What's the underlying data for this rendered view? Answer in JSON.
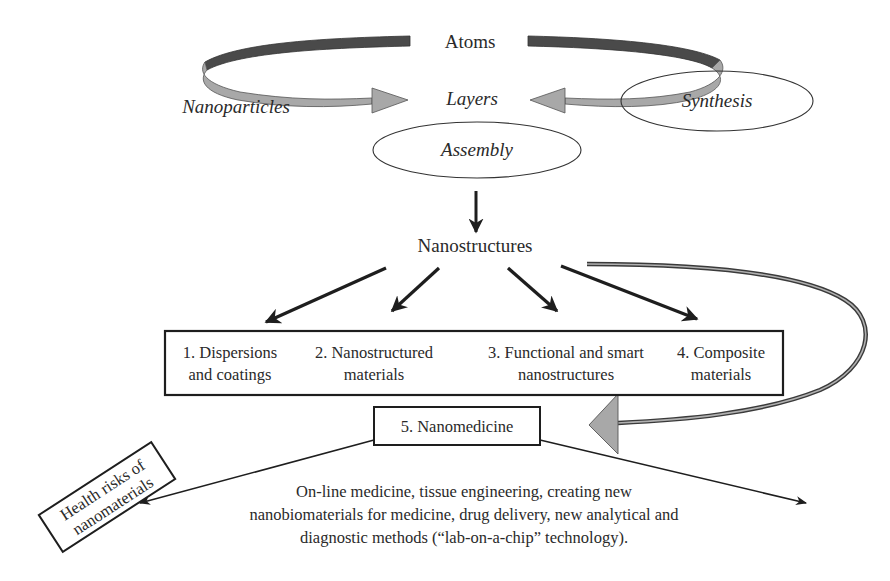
{
  "diagram": {
    "top": {
      "atoms": "Atoms",
      "layers": "Layers",
      "nanoparticles": "Nanoparticles",
      "synthesis": "Synthesis",
      "assembly": "Assembly"
    },
    "center": {
      "nanostructures": "Nanostructures"
    },
    "categories": [
      {
        "line1": "1. Dispersions",
        "line2": "and coatings"
      },
      {
        "line1": "2. Nanostructured",
        "line2": "materials"
      },
      {
        "line1": "3. Functional and smart",
        "line2": "nanostructures"
      },
      {
        "line1": "4. Composite",
        "line2": "materials"
      }
    ],
    "nanomedicine": {
      "label": "5. Nanomedicine"
    },
    "health_risks": {
      "line1": "Health risks of",
      "line2": "nanomaterials"
    },
    "description": {
      "line1": "On-line medicine, tissue engineering, creating new",
      "line2": "nanobiomaterials for medicine, drug delivery, new analytical and",
      "line3": "diagnostic methods (“lab-on-a-chip” technology)."
    },
    "colors": {
      "arc_dark": "#4a4a4a",
      "arc_light": "#a8a8a8",
      "stroke": "#1e1e1e",
      "text": "#2a2a2a"
    }
  }
}
